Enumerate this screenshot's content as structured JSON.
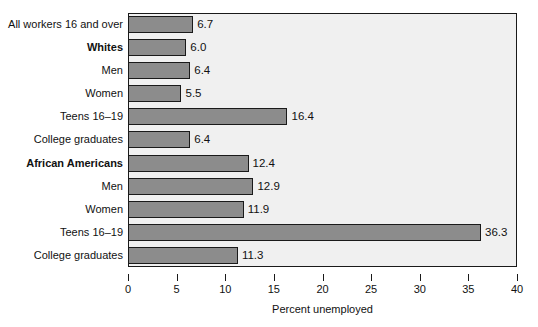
{
  "chart_data": {
    "type": "bar",
    "orientation": "horizontal",
    "title": "",
    "xlabel": "Percent unemployed",
    "ylabel": "",
    "xlim": [
      0,
      40
    ],
    "xticks": [
      0,
      5,
      10,
      15,
      20,
      25,
      30,
      35,
      40
    ],
    "xtick_labels": [
      "0",
      "5",
      "10",
      "15",
      "20",
      "25",
      "30",
      "35",
      "40"
    ],
    "grid": false,
    "legend": false,
    "categories": [
      "All workers 16 and over",
      "Whites",
      "Men",
      "Women",
      "Teens 16–19",
      "College graduates",
      "African Americans",
      "Men",
      "Women",
      "Teens 16–19",
      "College graduates"
    ],
    "values": [
      6.7,
      6.0,
      6.4,
      5.5,
      16.4,
      6.4,
      12.4,
      12.9,
      11.9,
      36.3,
      11.3
    ],
    "value_labels": [
      "6.7",
      "6.0",
      "6.4",
      "5.5",
      "16.4",
      "6.4",
      "12.4",
      "12.9",
      "11.9",
      "36.3",
      "11.3"
    ],
    "emphasis": [
      false,
      true,
      false,
      false,
      false,
      false,
      true,
      false,
      false,
      false,
      false
    ],
    "colors": {
      "bar_fill": "#8c8c8c",
      "bar_stroke": "#1a1a1a",
      "plot_background": "#f0f0f0",
      "page_background": "#ffffff",
      "text": "#111111"
    }
  }
}
